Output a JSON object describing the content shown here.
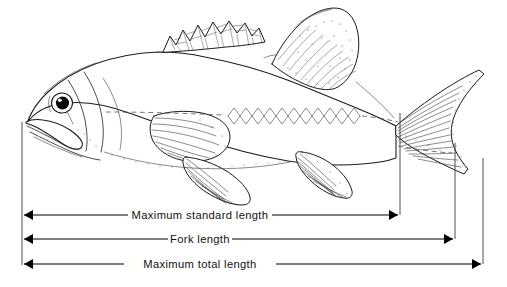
{
  "figure": {
    "background_color": "#ffffff",
    "ink_color": "#111111"
  },
  "measurements": [
    {
      "id": "standard-length",
      "label": "Maximum standard length",
      "label_x": 200,
      "label_y": 222,
      "row_y": 215,
      "left_x": 22,
      "right_x": 400,
      "drop_top_y": 113,
      "gap_start": 128,
      "gap_end": 272
    },
    {
      "id": "fork-length",
      "label": "Fork  length",
      "label_x": 200,
      "label_y": 245,
      "row_y": 239,
      "left_x": 22,
      "right_x": 455,
      "drop_top_y": 143,
      "gap_start": 168,
      "gap_end": 232
    },
    {
      "id": "total-length",
      "label": "Maximum  total  length",
      "label_x": 200,
      "label_y": 270,
      "row_y": 264,
      "left_x": 22,
      "right_x": 483,
      "drop_top_y": 158,
      "gap_start": 124,
      "gap_end": 276
    }
  ],
  "anatomy": {
    "eye": "fish-eye",
    "first_dorsal_fin": "spiny-dorsal-fin",
    "second_dorsal_fin": "soft-dorsal-fin",
    "pectoral_fin": "pectoral-fin",
    "pelvic_fin": "pelvic-fin",
    "anal_fin": "anal-fin",
    "caudal_fin": "forked-caudal-fin",
    "lateral_line": "scale-row-lateral-line",
    "snout": "snout-tip",
    "gill_cover": "operculum"
  },
  "reference_lines": {
    "snout_vertical_x": 22,
    "snout_vertical_top_y": 122,
    "snout_vertical_bottom_y": 265,
    "body_axis_dashed": "body-midline-dashed"
  }
}
